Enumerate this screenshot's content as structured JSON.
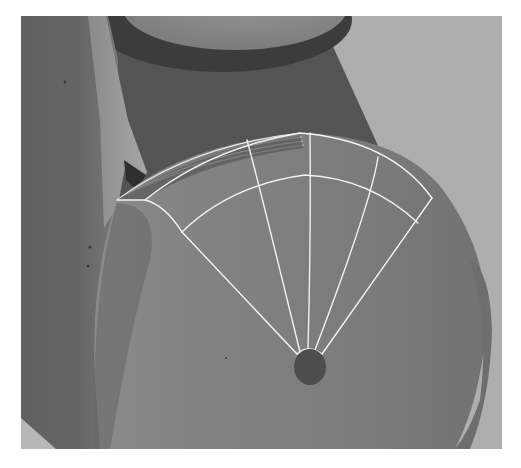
{
  "scene": {
    "description": "Grayscale 3D render of a cylindrical part with a highlighted wireframe sector on its circular face",
    "colors": {
      "page_background": "#ffffff",
      "viewport_background": "#aeaeae",
      "dark_body": "#555555",
      "left_wall": "#686868",
      "top_cylinder": "#8e8e8e",
      "top_cylinder_shadow": "#3e3e3e",
      "disc_face": "#7c7c7c",
      "disc_edge_dark": "#6a6a6a",
      "fin_light": "#9a9a9a",
      "center_hub": "#4d4d4d",
      "wireframe": "#f2f2f2"
    },
    "wireframe": {
      "hub_center": [
        308,
        366
      ],
      "radial_lines": 6,
      "arc_rings": 2
    }
  }
}
